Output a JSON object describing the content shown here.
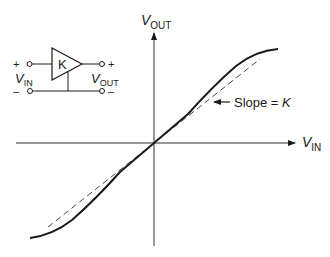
{
  "figure": {
    "type": "amplifier transfer characteristic",
    "colors": {
      "line": "#1a1a1a",
      "axis": "#333333",
      "dashed": "#444444",
      "background": "#ffffff"
    }
  },
  "amplifier": {
    "gain_label": "K",
    "input": {
      "plus": "+",
      "minus": "–",
      "label_main": "V",
      "label_sub": "IN"
    },
    "output": {
      "plus": "+",
      "minus": "–",
      "label_main": "V",
      "label_sub": "OUT"
    }
  },
  "axes": {
    "x_label_main": "V",
    "x_label_sub": "IN",
    "y_label_main": "V",
    "y_label_sub": "OUT"
  },
  "annotation": {
    "slope_text": "Slope = ",
    "slope_var": "K"
  },
  "curves": {
    "actual": "solid S-shaped transfer curve (saturating at extremes)",
    "ideal": "dashed straight line through origin with slope K"
  }
}
